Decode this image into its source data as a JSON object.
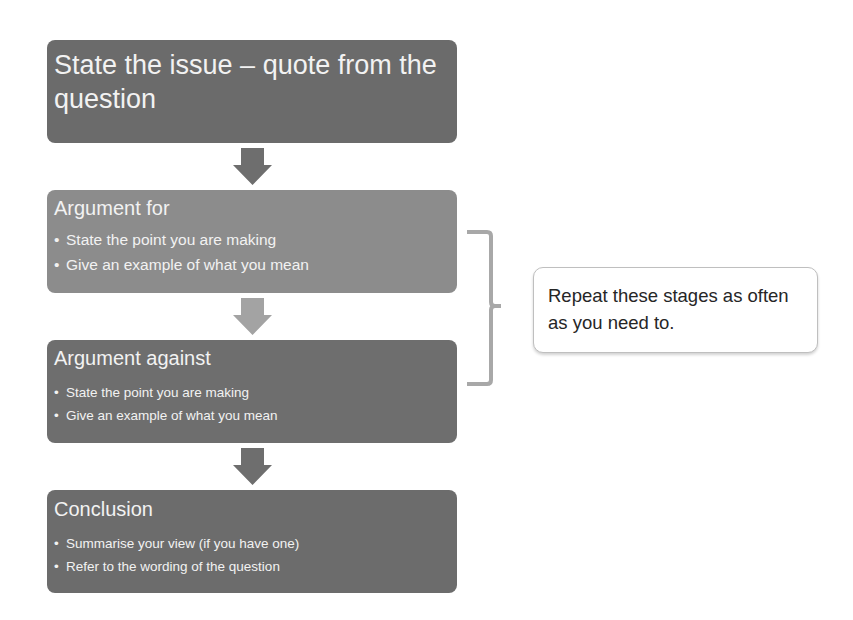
{
  "flow": {
    "issue": {
      "title": "State the issue – quote from the question",
      "color": "#6b6b6b"
    },
    "argument_for": {
      "title": "Argument for",
      "bullets": [
        "State the point you are making",
        "Give an example of what you mean"
      ],
      "color": "#8c8c8c"
    },
    "argument_against": {
      "title": "Argument against",
      "bullets": [
        "State the point you are making",
        "Give an example of what you mean"
      ],
      "color": "#6e6e6e"
    },
    "conclusion": {
      "title": "Conclusion",
      "bullets": [
        "Summarise your view (if you have one)",
        "Refer to the wording of the question"
      ],
      "color": "#6c6c6c"
    }
  },
  "arrows": [
    {
      "name": "issue-to-for",
      "color": "#6e6e6e"
    },
    {
      "name": "for-to-against",
      "color": "#a3a3a3"
    },
    {
      "name": "against-to-conclusion",
      "color": "#6e6e6e"
    }
  ],
  "callout": {
    "text": "Repeat these stages as often as you need to."
  }
}
